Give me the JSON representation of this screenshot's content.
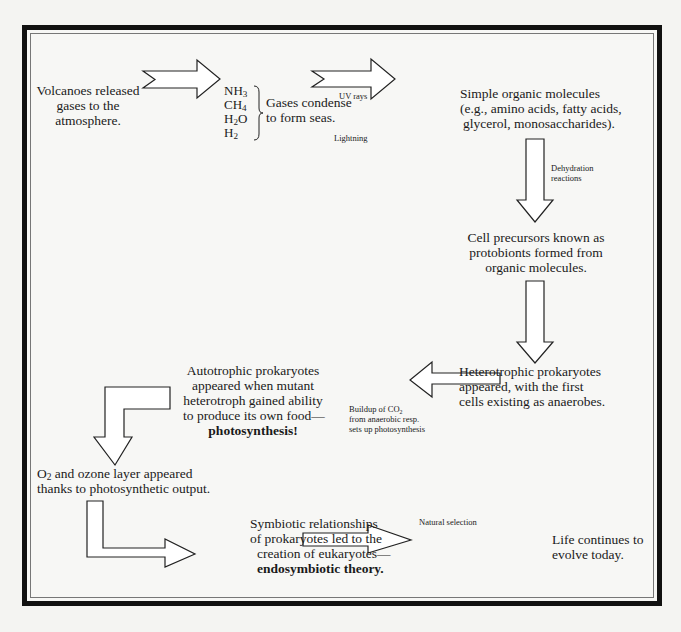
{
  "diagram": {
    "nodes": {
      "volcanoes": [
        "Volcanoes released",
        "gases to the",
        "atmosphere."
      ],
      "gases": [
        {
          "base": "NH",
          "sub": "3",
          "tail": ""
        },
        {
          "base": "CH",
          "sub": "4",
          "tail": ""
        },
        {
          "base": "H",
          "sub": "2",
          "tail": "O"
        },
        {
          "base": "H",
          "sub": "2",
          "tail": ""
        }
      ],
      "condense": [
        "Gases condense",
        "to form seas."
      ],
      "simple_organic": [
        "Simple organic molecules",
        "(e.g., amino acids, fatty acids,",
        "glycerol, monosaccharides)."
      ],
      "protobionts": [
        "Cell precursors known as",
        "protobionts formed from",
        "organic molecules."
      ],
      "heterotrophic": [
        "Heterotrophic prokaryotes",
        "appeared, with the first",
        "cells existing as anaerobes."
      ],
      "autotrophic": [
        "Autotrophic prokaryotes",
        "appeared when mutant",
        "heterotroph gained ability",
        "to produce its own food—"
      ],
      "autotrophic_bold": "photosynthesis!",
      "oxygen": {
        "o2_base": "O",
        "o2_sub": "2",
        "line1_rest": " and ozone layer appeared",
        "line2": "thanks to photosynthetic output."
      },
      "symbiotic": [
        "Symbiotic relationships",
        "of prokaryotes led to the",
        "creation of eukaryotes—"
      ],
      "symbiotic_bold": "endosymbiotic theory.",
      "life": [
        "Life continues to",
        "evolve today."
      ]
    },
    "edge_labels": {
      "uv": "UV rays",
      "lightning": "Lightning",
      "dehydration": [
        "Dehydration",
        "reactions"
      ],
      "co2": {
        "pre": "Buildup of CO",
        "sub": "2",
        "line2": "from anaerobic resp.",
        "line3": "sets up photosynthesis"
      },
      "natural_selection": "Natural selection"
    },
    "colors": {
      "frame": "#111111",
      "arrow_fill": "#ffffff",
      "arrow_stroke": "#222222",
      "background": "#f4f4f2"
    }
  }
}
